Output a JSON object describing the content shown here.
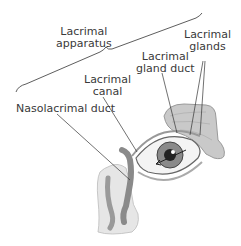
{
  "diagram": {
    "labels": {
      "apparatus": [
        "Lacrimal",
        "apparatus"
      ],
      "glands": [
        "Lacrimal",
        "glands"
      ],
      "gland_duct": [
        "Lacrimal",
        "gland duct"
      ],
      "canal": [
        "Lacrimal",
        "canal"
      ],
      "nasolacrimal": "Nasolacrimal duct"
    },
    "colors": {
      "text": "#3a3a3a",
      "line": "#333333",
      "gland": "#b8b8b8",
      "duct": "#8a8a8a"
    }
  }
}
